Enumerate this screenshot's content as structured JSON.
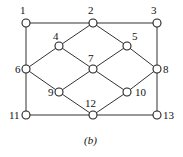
{
  "diagram": {
    "caption": "(b)",
    "nodes": [
      {
        "id": "1",
        "x": 26,
        "y": 23,
        "lx": 20,
        "ly": 14
      },
      {
        "id": "2",
        "x": 93,
        "y": 23,
        "lx": 88,
        "ly": 14
      },
      {
        "id": "3",
        "x": 157,
        "y": 23,
        "lx": 151,
        "ly": 14
      },
      {
        "id": "4",
        "x": 59,
        "y": 46,
        "lx": 53,
        "ly": 40
      },
      {
        "id": "5",
        "x": 127,
        "y": 46,
        "lx": 132,
        "ly": 40
      },
      {
        "id": "6",
        "x": 26,
        "y": 69,
        "lx": 15,
        "ly": 73
      },
      {
        "id": "7",
        "x": 93,
        "y": 69,
        "lx": 88,
        "ly": 62
      },
      {
        "id": "8",
        "x": 157,
        "y": 69,
        "lx": 163,
        "ly": 73
      },
      {
        "id": "9",
        "x": 59,
        "y": 92,
        "lx": 48,
        "ly": 96
      },
      {
        "id": "10",
        "x": 127,
        "y": 92,
        "lx": 135,
        "ly": 96
      },
      {
        "id": "11",
        "x": 26,
        "y": 115,
        "lx": 9,
        "ly": 119
      },
      {
        "id": "12",
        "x": 93,
        "y": 115,
        "lx": 85,
        "ly": 107
      },
      {
        "id": "13",
        "x": 157,
        "y": 115,
        "lx": 163,
        "ly": 119
      }
    ],
    "edges": [
      [
        "1",
        "2"
      ],
      [
        "2",
        "3"
      ],
      [
        "1",
        "6"
      ],
      [
        "3",
        "8"
      ],
      [
        "2",
        "4"
      ],
      [
        "2",
        "5"
      ],
      [
        "4",
        "6"
      ],
      [
        "4",
        "7"
      ],
      [
        "5",
        "7"
      ],
      [
        "5",
        "8"
      ],
      [
        "6",
        "9"
      ],
      [
        "7",
        "9"
      ],
      [
        "7",
        "10"
      ],
      [
        "8",
        "10"
      ],
      [
        "6",
        "11"
      ],
      [
        "8",
        "13"
      ],
      [
        "9",
        "12"
      ],
      [
        "10",
        "12"
      ],
      [
        "11",
        "12"
      ],
      [
        "12",
        "13"
      ]
    ]
  }
}
